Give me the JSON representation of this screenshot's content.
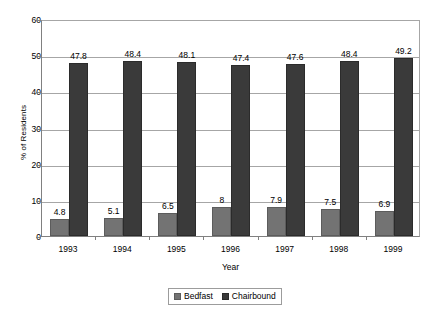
{
  "chart_data": {
    "type": "bar",
    "title": "",
    "xlabel": "Year",
    "ylabel": "% of Residents",
    "categories": [
      "1993",
      "1994",
      "1995",
      "1996",
      "1997",
      "1998",
      "1999"
    ],
    "series": [
      {
        "name": "Bedfast",
        "color": "#737373",
        "values": [
          4.8,
          5.1,
          6.5,
          8,
          7.9,
          7.5,
          6.9
        ],
        "labels": [
          "4.8",
          "5.1",
          "6.5",
          "8",
          "7.9",
          "7.5",
          "6.9"
        ]
      },
      {
        "name": "Chairbound",
        "color": "#3a3a3a",
        "values": [
          47.8,
          48.4,
          48.1,
          47.4,
          47.6,
          48.4,
          49.2
        ],
        "labels": [
          "47.8",
          "48.4",
          "48.1",
          "47.4",
          "47.6",
          "48.4",
          "49.2"
        ]
      }
    ],
    "ylim": [
      0,
      60
    ],
    "yticks": [
      0,
      10,
      20,
      30,
      40,
      50,
      60
    ],
    "ytick_labels": [
      "0",
      "10",
      "20",
      "30",
      "40",
      "50",
      "60"
    ],
    "grid": true,
    "legend_position": "bottom-center"
  },
  "legend": {
    "items": [
      {
        "label": "Bedfast"
      },
      {
        "label": "Chairbound"
      }
    ]
  }
}
